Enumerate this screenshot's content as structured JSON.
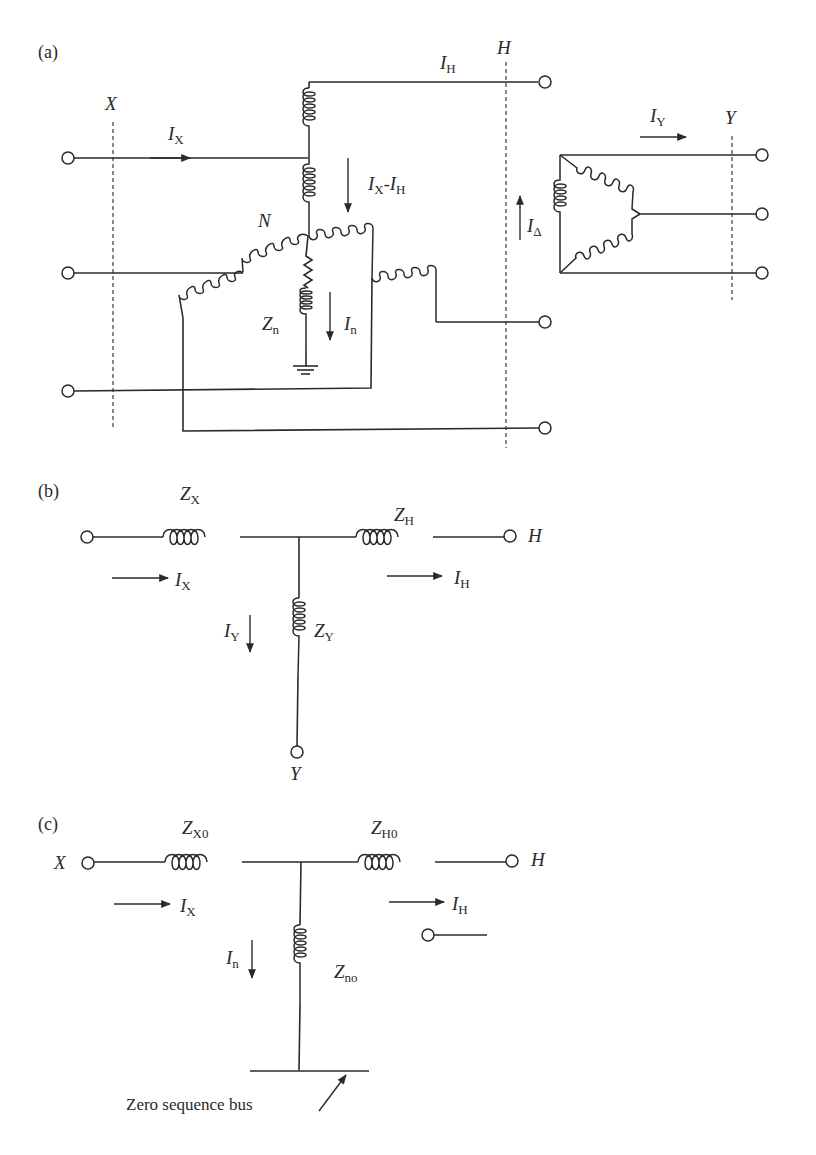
{
  "figure": {
    "panels": [
      {
        "id": "a",
        "label": "(a)",
        "bus_labels": {
          "x": "X",
          "h": "H",
          "y": "Y"
        },
        "neutral_label": "N",
        "currents": {
          "ix": {
            "main": "I",
            "sub": "X"
          },
          "ih": {
            "main": "I",
            "sub": "H"
          },
          "ix_minus_ih": {
            "main1": "I",
            "sub1": "X",
            "dash": "-",
            "main2": "I",
            "sub2": "H"
          },
          "in": {
            "main": "I",
            "sub": "n"
          },
          "iy": {
            "main": "I",
            "sub": "Y"
          },
          "idelta": {
            "main": "I",
            "sub": "Δ"
          }
        },
        "impedances": {
          "zn": {
            "main": "Z",
            "sub": "n"
          }
        }
      },
      {
        "id": "b",
        "label": "(b)",
        "impedances": {
          "zx": {
            "main": "Z",
            "sub": "X"
          },
          "zh": {
            "main": "Z",
            "sub": "H"
          },
          "zy": {
            "main": "Z",
            "sub": "Y"
          }
        },
        "currents": {
          "ix": {
            "main": "I",
            "sub": "X"
          },
          "ih": {
            "main": "I",
            "sub": "H"
          },
          "iy": {
            "main": "I",
            "sub": "Y"
          }
        },
        "terminals": {
          "h": "H",
          "y": "Y"
        }
      },
      {
        "id": "c",
        "label": "(c)",
        "impedances": {
          "zx0": {
            "main": "Z",
            "sub": "X0"
          },
          "zh0": {
            "main": "Z",
            "sub": "H0"
          },
          "zno": {
            "main": "Z",
            "sub": "no"
          }
        },
        "currents": {
          "ix": {
            "main": "I",
            "sub": "X"
          },
          "ih": {
            "main": "I",
            "sub": "H"
          },
          "in": {
            "main": "I",
            "sub": "n"
          }
        },
        "terminals": {
          "x": "X",
          "h": "H"
        },
        "bus_caption": "Zero sequence bus"
      }
    ],
    "colors": {
      "ink": "#2a2a2a",
      "background": "#ffffff"
    }
  }
}
